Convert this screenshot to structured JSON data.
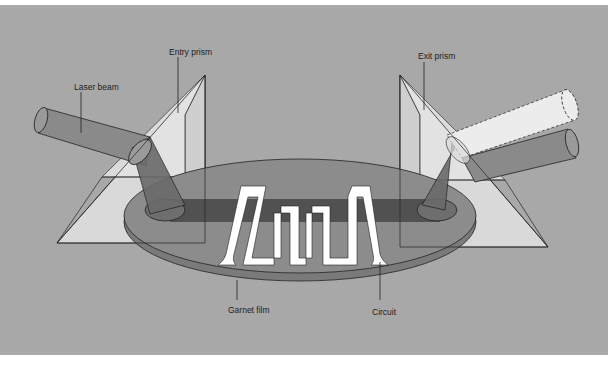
{
  "diagram": {
    "title": "",
    "labels": {
      "laser_beam": "Laser beam",
      "entry_prism": "Entry prism",
      "exit_prism": "Exit prism",
      "garnet_film": "Garnet film",
      "circuit": "Circuit"
    },
    "components": [
      {
        "id": "laser_beam",
        "label": "Laser beam",
        "description": "Incoming cylindrical beam entering the entry prism"
      },
      {
        "id": "entry_prism",
        "label": "Entry prism",
        "description": "Transparent triangular prism on left coupling beam into film"
      },
      {
        "id": "garnet_film",
        "label": "Garnet film",
        "description": "Elliptical thin film disc carrying the guided beam"
      },
      {
        "id": "circuit",
        "label": "Circuit",
        "description": "White serpentine conductor pattern on the film"
      },
      {
        "id": "exit_prism",
        "label": "Exit prism",
        "description": "Transparent triangular prism on right coupling beam out; two output beams (one dashed outline)"
      }
    ],
    "colors": {
      "background": "#a8a8a8",
      "prism": "#dcdcdc",
      "beam": "#8a8a8a",
      "film": "#8c8c8c",
      "film_edge": "#7a7a7a",
      "guided_beam": "#4a4a4a",
      "circuit": "#ffffff",
      "exit_beam_light": "#ececec",
      "line": "#222222"
    }
  }
}
